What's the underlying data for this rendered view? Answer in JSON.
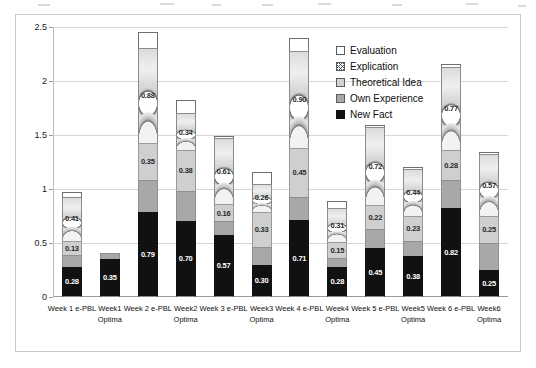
{
  "chart_data": {
    "type": "bar",
    "subtype": "stacked",
    "title": "",
    "xlabel": "",
    "ylabel": "",
    "ylim": [
      0,
      2.5
    ],
    "yticks": [
      "0",
      "0.5",
      "1",
      "1.5",
      "2",
      "2.5"
    ],
    "grid": true,
    "legend_position": "top-right",
    "categories": [
      {
        "line1": "Week 1 e-PBL",
        "line2": ""
      },
      {
        "line1": "Week1",
        "line2": "Optima"
      },
      {
        "line1": "Week 2 e-PBL",
        "line2": ""
      },
      {
        "line1": "Week2",
        "line2": "Optima"
      },
      {
        "line1": "Week 3 e-PBL",
        "line2": ""
      },
      {
        "line1": "Week3",
        "line2": "Optima"
      },
      {
        "line1": "Week 4 e-PBL",
        "line2": ""
      },
      {
        "line1": "Week4",
        "line2": "Optima"
      },
      {
        "line1": "Week 5 e-PBL",
        "line2": ""
      },
      {
        "line1": "Week5",
        "line2": "Optima"
      },
      {
        "line1": "Week 6 e-PBL",
        "line2": ""
      },
      {
        "line1": "Week6",
        "line2": "Optima"
      }
    ],
    "series": [
      {
        "name": "New Fact",
        "color": "#111111",
        "values": [
          0.28,
          0.35,
          0.79,
          0.7,
          0.57,
          0.3,
          0.71,
          0.28,
          0.45,
          0.38,
          0.82,
          0.25
        ],
        "labels": [
          "0.28",
          "0.35",
          "0.79",
          "0.70",
          "0.57",
          "0.30",
          "0.71",
          "0.28",
          "0.45",
          "0.38",
          "0.82",
          "0.25"
        ]
      },
      {
        "name": "Own Experience",
        "color": "#a8a8a8",
        "values": [
          0.11,
          0.06,
          0.29,
          0.28,
          0.13,
          0.16,
          0.22,
          0.08,
          0.18,
          0.14,
          0.26,
          0.25
        ],
        "labels": [
          "",
          "",
          "",
          "",
          "",
          "",
          "",
          "",
          "",
          "",
          "",
          ""
        ]
      },
      {
        "name": "Theoretical Idea",
        "color": "#cfcfcf",
        "values": [
          0.13,
          0.0,
          0.35,
          0.38,
          0.16,
          0.33,
          0.45,
          0.15,
          0.22,
          0.23,
          0.28,
          0.25
        ],
        "labels": [
          "0.13",
          "",
          "0.35",
          "0.38",
          "0.16",
          "0.33",
          "0.45",
          "0.15",
          "0.22",
          "0.23",
          "0.28",
          "0.25"
        ]
      },
      {
        "name": "Explication",
        "color": "#d4d4d4",
        "values": [
          0.41,
          0.0,
          0.88,
          0.34,
          0.61,
          0.26,
          0.9,
          0.31,
          0.72,
          0.44,
          0.77,
          0.57
        ],
        "labels": [
          "0.41",
          "",
          "0.88",
          "0.34",
          "0.61",
          "0.26",
          "0.90",
          "0.31",
          "0.72",
          "0.44",
          "0.77",
          "0.57"
        ]
      },
      {
        "name": "Evaluation",
        "color": "#ffffff",
        "values": [
          0.04,
          0.0,
          0.14,
          0.12,
          0.02,
          0.11,
          0.12,
          0.07,
          0.02,
          0.01,
          0.03,
          0.02
        ],
        "labels": [
          "",
          "",
          "",
          "",
          "",
          "",
          "",
          "",
          "",
          "",
          "",
          ""
        ]
      }
    ],
    "totals": [
      0.97,
      0.41,
      2.45,
      1.82,
      1.49,
      1.16,
      2.3,
      0.89,
      1.59,
      1.2,
      2.16,
      1.34
    ]
  },
  "legend": {
    "items": [
      {
        "label": "Evaluation",
        "swatch": "sw-evaluation"
      },
      {
        "label": "Explication",
        "swatch": "sw-explication"
      },
      {
        "label": "Theoretical Idea",
        "swatch": "sw-theory"
      },
      {
        "label": "Own Experience",
        "swatch": "sw-own-exp"
      },
      {
        "label": "New Fact",
        "swatch": "sw-new-fact"
      }
    ]
  }
}
